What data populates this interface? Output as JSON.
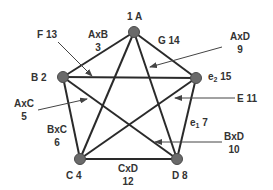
{
  "colors": {
    "edge": "#2a2a2a",
    "node_fill": "#6a6a6a",
    "node_stroke": "#4a4a4a",
    "arrow": "#444444",
    "text": "#333333",
    "background": "#ffffff"
  },
  "nodes": [
    {
      "id": "A",
      "label": "1  A",
      "x": 134,
      "y": 32
    },
    {
      "id": "B",
      "label": "B  2",
      "x": 63,
      "y": 77
    },
    {
      "id": "e2",
      "label_main": "e",
      "label_sub": "2",
      "label_num": " 15",
      "x": 196,
      "y": 78
    },
    {
      "id": "C",
      "label": "C  4",
      "x": 80,
      "y": 159
    },
    {
      "id": "D",
      "label": "D  8",
      "x": 177,
      "y": 159
    }
  ],
  "edges": [
    [
      "A",
      "B"
    ],
    [
      "A",
      "C"
    ],
    [
      "A",
      "D"
    ],
    [
      "A",
      "e2"
    ],
    [
      "B",
      "C"
    ],
    [
      "B",
      "D"
    ],
    [
      "B",
      "e2"
    ],
    [
      "C",
      "D"
    ],
    [
      "C",
      "e2"
    ],
    [
      "D",
      "e2"
    ]
  ],
  "annotations": {
    "AxB": {
      "name": "AxB",
      "value": "3"
    },
    "AxC": {
      "name": "AxC",
      "value": "5"
    },
    "BxC": {
      "name": "BxC",
      "value": "6"
    },
    "CxD": {
      "name": "CxD",
      "value": "12"
    },
    "AxD": {
      "name": "AxD",
      "value": "9"
    },
    "BxD": {
      "name": "BxD",
      "value": "10"
    },
    "F": {
      "label": "F  13"
    },
    "G": {
      "label": "G  14"
    },
    "E": {
      "label": "E  11"
    },
    "e1": {
      "main": "e",
      "sub": "1",
      "num": "  7"
    }
  }
}
